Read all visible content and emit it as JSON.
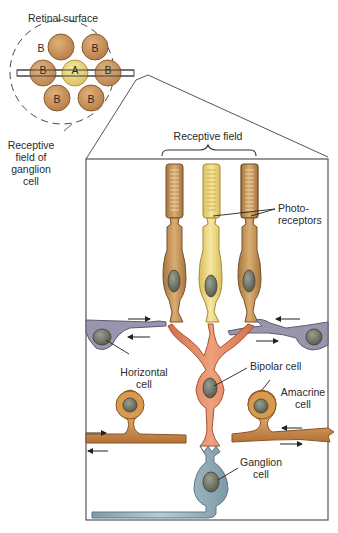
{
  "figure": {
    "inset": {
      "title": "Retinal surface",
      "center_cell_label": "A",
      "surround_cell_label": "B",
      "surround_count": 6,
      "caption_lines": [
        "Receptive",
        "field of",
        "ganglion",
        "cell"
      ]
    },
    "detail": {
      "receptive_field_label": "Receptive field",
      "labels": {
        "photoreceptors": [
          "Photo-",
          "receptors"
        ],
        "horizontal_cell": [
          "Horizontal",
          "cell"
        ],
        "bipolar_cell": "Bipolar cell",
        "amacrine_cell": [
          "Amacrine",
          "cell"
        ],
        "ganglion_cell": [
          "Ganglion",
          "cell"
        ]
      }
    },
    "colors": {
      "photoreceptor_outer": "#c99a5e",
      "photoreceptor_center": "#f0dc86",
      "horizontal_cell": "#9a95ad",
      "bipolar_cell": "#e8906a",
      "amacrine_cell": "#d89a4e",
      "ganglion_cell": "#9fb8c4",
      "nucleus": "#6d7060",
      "frame": "#555555"
    }
  }
}
